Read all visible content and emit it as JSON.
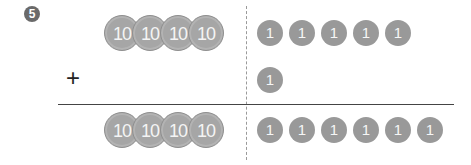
{
  "problem": {
    "number": "5",
    "operator": "+",
    "top": {
      "tens": [
        "10",
        "10",
        "10",
        "10"
      ],
      "ones": [
        "1",
        "1",
        "1",
        "1",
        "1"
      ]
    },
    "addend": {
      "tens": [],
      "ones": [
        "1"
      ]
    },
    "result": {
      "tens": [
        "10",
        "10",
        "10",
        "10"
      ],
      "ones": [
        "1",
        "1",
        "1",
        "1",
        "1",
        "1"
      ]
    }
  },
  "colors": {
    "coin_ten": "#a6a6a6",
    "coin_one": "#999999",
    "badge": "#6a6a6a"
  }
}
